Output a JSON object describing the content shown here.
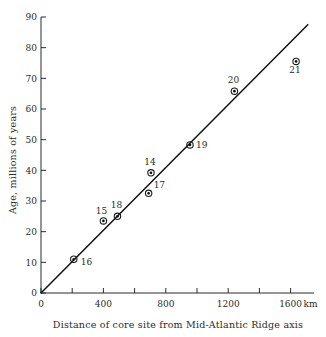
{
  "chart_data": {
    "type": "scatter",
    "title": "",
    "xlabel": "Distance of core site from Mid-Atlantic Ridge  axis",
    "ylabel": "Age, millions of years",
    "x_unit_label": "km",
    "xlim": [
      0,
      1750
    ],
    "ylim": [
      0,
      90
    ],
    "grid": false,
    "legend": "none",
    "x_ticks": [
      0,
      400,
      800,
      1200,
      1600
    ],
    "x_tick_labels": [
      "0",
      "400",
      "800",
      "1200",
      "1600"
    ],
    "x_minor_ticks": [
      200,
      600,
      1000,
      1400
    ],
    "y_ticks": [
      0,
      10,
      20,
      30,
      40,
      50,
      60,
      70,
      80,
      90
    ],
    "y_tick_labels": [
      "0",
      "10",
      "20",
      "30",
      "40",
      "50",
      "60",
      "70",
      "80",
      "90"
    ],
    "points": [
      {
        "label": "16",
        "x": 210,
        "y": 11.0,
        "label_dx": 7,
        "label_dy": 6
      },
      {
        "label": "15",
        "x": 400,
        "y": 23.5,
        "label_dx": -2,
        "label_dy": -7
      },
      {
        "label": "18",
        "x": 490,
        "y": 25.0,
        "label_dx": -1,
        "label_dy": -8
      },
      {
        "label": "17",
        "x": 690,
        "y": 32.5,
        "label_dx": 5,
        "label_dy": -5
      },
      {
        "label": "14",
        "x": 705,
        "y": 39.2,
        "label_dx": -1,
        "label_dy": -8
      },
      {
        "label": "19",
        "x": 955,
        "y": 48.3,
        "label_dx": 6,
        "label_dy": 3
      },
      {
        "label": "20",
        "x": 1240,
        "y": 65.8,
        "label_dx": -1,
        "label_dy": -8
      },
      {
        "label": "21",
        "x": 1635,
        "y": 75.5,
        "label_dx": -1,
        "label_dy": 12
      }
    ],
    "trend_line": {
      "x_start": 0,
      "y_start": 0,
      "x_end": 1710,
      "y_end": 87.5
    },
    "colors": {
      "axis": "#2b2b2b",
      "marker": "#111111",
      "line": "#111111",
      "text": "#2b2b2b",
      "background": "#ffffff"
    }
  }
}
